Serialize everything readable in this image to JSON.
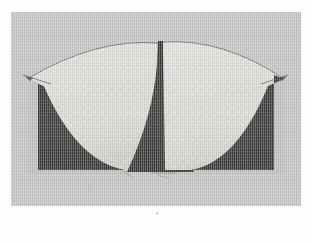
{
  "page": {
    "background_color": "#fdfdfd",
    "caption_mark": "*"
  },
  "photo": {
    "board_color": "#c5c5c4",
    "light_fan_color": "#d9d9d6",
    "dark_region_color": "#3c3b39",
    "center_spike_color": "#3a3937",
    "edge_line_color": "#4a4a48",
    "shadow_color": "#a9a8a6"
  },
  "figure": {
    "shapes": [
      {
        "name": "left-dark-region",
        "fill": "#3c3b39",
        "role": "outer dark quadrant with concave edge"
      },
      {
        "name": "left-light-sector",
        "fill": "#d9d9d6",
        "role": "pale fan blade"
      },
      {
        "name": "center-dark-spike",
        "fill": "#3a3937",
        "role": "narrow tapering wedge at centre"
      },
      {
        "name": "right-light-sector",
        "fill": "#d9d9d6",
        "role": "pale fan blade"
      },
      {
        "name": "right-dark-region",
        "fill": "#3c3b39",
        "role": "outer dark quadrant with concave edge"
      }
    ],
    "markings": [
      {
        "name": "left-arc-tip-line",
        "kind": "thin drawn line"
      },
      {
        "name": "right-arc-tip-line",
        "kind": "thin drawn line"
      },
      {
        "name": "top-arc-outline",
        "kind": "thin drawn arc"
      }
    ]
  }
}
